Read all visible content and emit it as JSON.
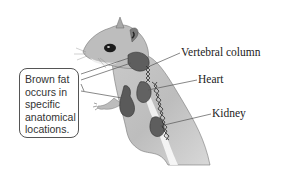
{
  "figure": {
    "callout": {
      "lines": [
        "Brown fat",
        "occurs in",
        "specific",
        "anatomical",
        "locations."
      ]
    },
    "labels": {
      "vertebral_column": "Vertebral column",
      "heart": "Heart",
      "kidney": "Kidney"
    },
    "colors": {
      "background": "#ffffff",
      "fur": "#b8b8b8",
      "fur_dark": "#8a8a8a",
      "brown_fat": "#5e5e5e",
      "spine": "#3a3a3a",
      "leader_line": "#555555"
    }
  }
}
